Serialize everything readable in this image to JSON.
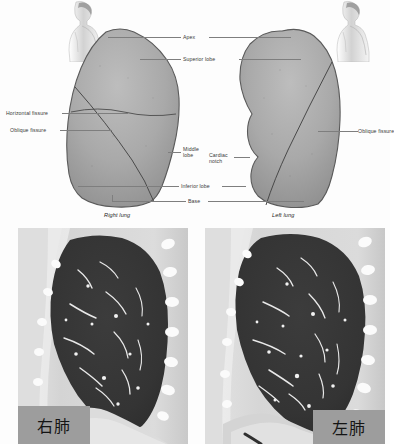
{
  "figure": {
    "type": "medical-anatomy-and-ct",
    "top_panel": {
      "name": "lung-anatomy-diagram",
      "labels": {
        "apex": "Apex",
        "superior_lobe": "Superior lobe",
        "horizontal_fissure": "Horizontal fissure",
        "oblique_fissure_left_side": "Oblique fissure",
        "middle_lobe": "Middle lobe",
        "cardiac_notch": "Cardiac notch",
        "inferior_lobe": "Inferior lobe",
        "base": "Base",
        "oblique_fissure_right_side": "Oblique fissure",
        "right_lung": "Right lung",
        "left_lung": "Left lung"
      },
      "icons": {
        "left_torso": "torso-profile-icon",
        "right_torso": "torso-profile-icon"
      }
    },
    "bottom_panel": {
      "name": "ct-scan-pair",
      "left_scan": {
        "caption": "右肺",
        "modality": "CT",
        "view": "sagittal"
      },
      "right_scan": {
        "caption": "左肺",
        "modality": "CT",
        "view": "sagittal"
      }
    },
    "colors": {
      "page_background": "#fdfdfd",
      "lung_fill": "#a8a8a8",
      "lung_outline": "#585858",
      "leader_line": "#7e7e7e",
      "label_text": "#3a3a3a",
      "caption_box": "#9d9d9d",
      "caption_text": "#141414",
      "ct_lung_dark": "#3a3a3a",
      "ct_soft_tissue": "#d8d8d8",
      "ct_bone_bright": "#fbfbfb"
    }
  }
}
